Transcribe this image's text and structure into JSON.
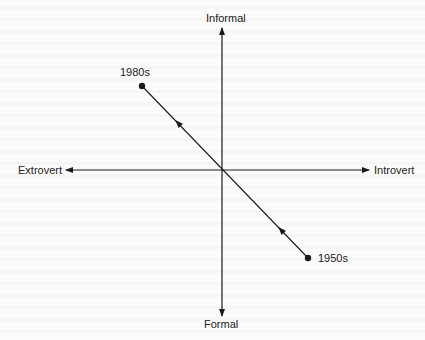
{
  "diagram": {
    "axes": {
      "top_label": "Informal",
      "bottom_label": "Formal",
      "left_label": "Extrovert",
      "right_label": "Introvert"
    },
    "points": [
      {
        "label": "1980s",
        "position": "upper-left (extrovert, informal)"
      },
      {
        "label": "1950s",
        "position": "lower-right (introvert, formal)"
      }
    ],
    "trend": {
      "from": "1950s",
      "to": "1980s",
      "direction": "toward extrovert and informal"
    },
    "colors": {
      "ink": "#1a1a1a",
      "background": "#fbfbfb"
    }
  }
}
